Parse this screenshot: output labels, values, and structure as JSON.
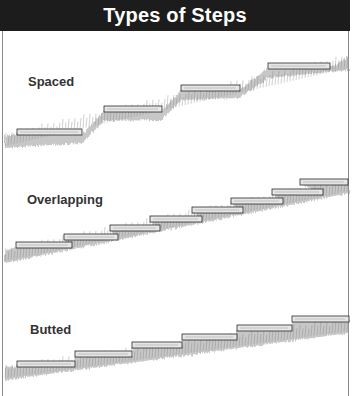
{
  "header": {
    "title": "Types of Steps",
    "bg_color": "#1c1c1c",
    "text_color": "#ffffff"
  },
  "sections": [
    {
      "id": "spaced",
      "label": "Spaced",
      "label_pos": [
        28,
        82
      ],
      "steps": [
        {
          "x1": 17,
          "x2": 82,
          "y": 129
        },
        {
          "x1": 104,
          "x2": 162,
          "y": 106
        },
        {
          "x1": 181,
          "x2": 240,
          "y": 85
        },
        {
          "x1": 268,
          "x2": 330,
          "y": 63
        }
      ],
      "slope": [
        [
          5,
          140
        ],
        [
          82,
          135
        ],
        [
          104,
          113
        ],
        [
          162,
          112
        ],
        [
          181,
          92
        ],
        [
          240,
          90
        ],
        [
          268,
          70
        ],
        [
          349,
          62
        ]
      ]
    },
    {
      "id": "overlapping",
      "label": "Overlapping",
      "label_pos": [
        27,
        200
      ],
      "steps": [
        {
          "x1": 16,
          "x2": 72,
          "y": 242
        },
        {
          "x1": 64,
          "x2": 118,
          "y": 234
        },
        {
          "x1": 110,
          "x2": 160,
          "y": 225
        },
        {
          "x1": 150,
          "x2": 202,
          "y": 216
        },
        {
          "x1": 192,
          "x2": 243,
          "y": 207
        },
        {
          "x1": 231,
          "x2": 283,
          "y": 198
        },
        {
          "x1": 272,
          "x2": 323,
          "y": 189
        },
        {
          "x1": 300,
          "x2": 348,
          "y": 179
        }
      ],
      "slope": [
        [
          5,
          255
        ],
        [
          349,
          185
        ]
      ]
    },
    {
      "id": "butted",
      "label": "Butted",
      "label_pos": [
        30,
        330
      ],
      "steps": [
        {
          "x1": 17,
          "x2": 75,
          "y": 361
        },
        {
          "x1": 75,
          "x2": 132,
          "y": 351
        },
        {
          "x1": 132,
          "x2": 182,
          "y": 342
        },
        {
          "x1": 182,
          "x2": 237,
          "y": 334
        },
        {
          "x1": 237,
          "x2": 292,
          "y": 325
        },
        {
          "x1": 292,
          "x2": 349,
          "y": 316
        }
      ],
      "slope": [
        [
          5,
          372
        ],
        [
          349,
          325
        ]
      ]
    }
  ],
  "colors": {
    "board_fill": "#e6e6e6",
    "board_stroke": "#2a2a2a",
    "grass": "#9a9a9a",
    "border": "#8a8a8a"
  }
}
